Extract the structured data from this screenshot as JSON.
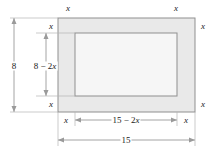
{
  "figure": {
    "type": "geometry-diagram",
    "width": 217,
    "height": 155,
    "colors": {
      "background": "#ffffff",
      "band_fill": "#e8e8e8",
      "inner_fill": "#f4f4f4",
      "line": "#8a8a8a",
      "dimension_line": "#9a9a9a",
      "text": "#1a1a1a"
    },
    "shape": {
      "outer_rect": {
        "x": 58,
        "y": 18,
        "width": 137,
        "height": 94,
        "label_width": "15",
        "label_height": "8"
      },
      "inner_rect": {
        "x": 75,
        "y": 33,
        "width": 102,
        "height": 63,
        "label_width": "15 - 2x",
        "label_height": "8 - 2x"
      },
      "border_variable": "x"
    },
    "labels": {
      "top_left_x": "x",
      "top_right_x": "x",
      "left_upper_x": "x",
      "left_lower_x": "x",
      "right_upper_x": "x",
      "right_lower_x": "x",
      "bottom_left_x": "x",
      "bottom_right_x": "x",
      "height_outer": "8",
      "height_inner_prefix": "8 − 2",
      "height_inner_var": "x",
      "width_inner_prefix": "15 − 2",
      "width_inner_var": "x",
      "width_outer": "15"
    }
  }
}
